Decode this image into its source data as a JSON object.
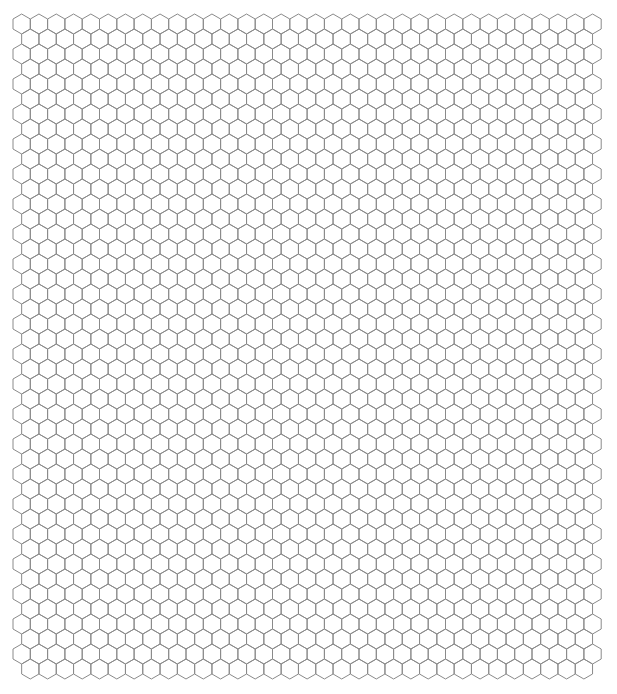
{
  "grid": {
    "orientation": "pointy-top",
    "rows": 44,
    "cols_even_row": 34,
    "cols_odd_row": 33,
    "hex_width": 17.3,
    "hex_radius": 10,
    "origin_x": 13,
    "origin_y": 14,
    "stroke_color": "#8a8a8a",
    "stroke_width": 1,
    "background": "#ffffff"
  }
}
